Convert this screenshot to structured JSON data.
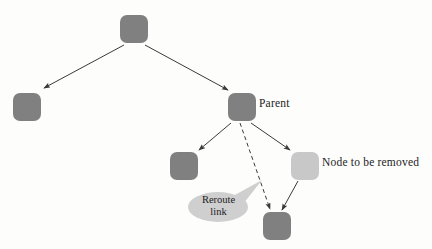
{
  "diagram": {
    "background_color": "#fdfdfc",
    "node_dark_color": "#808080",
    "node_light_color": "#c8c8c8",
    "edge_color": "#3a3a3a",
    "callout_fill": "#cfcfcf",
    "nodes": [
      {
        "id": "root",
        "shade": "dark",
        "x": 120,
        "y": 15,
        "w": 28,
        "h": 28
      },
      {
        "id": "left",
        "shade": "dark",
        "x": 13,
        "y": 93,
        "w": 28,
        "h": 28
      },
      {
        "id": "parent",
        "shade": "dark",
        "x": 228,
        "y": 93,
        "w": 28,
        "h": 28
      },
      {
        "id": "middle",
        "shade": "dark",
        "x": 170,
        "y": 152,
        "w": 28,
        "h": 28
      },
      {
        "id": "removed",
        "shade": "light",
        "x": 291,
        "y": 152,
        "w": 28,
        "h": 28
      },
      {
        "id": "bottom",
        "shade": "dark",
        "x": 263,
        "y": 212,
        "w": 28,
        "h": 28
      }
    ],
    "edges": [
      {
        "id": "root-to-left",
        "style": "solid",
        "from": "root",
        "to": "left"
      },
      {
        "id": "root-to-parent",
        "style": "solid",
        "from": "root",
        "to": "parent"
      },
      {
        "id": "parent-to-middle",
        "style": "solid",
        "from": "parent",
        "to": "middle"
      },
      {
        "id": "parent-to-removed",
        "style": "solid",
        "from": "parent",
        "to": "removed"
      },
      {
        "id": "removed-to-bottom",
        "style": "solid",
        "from": "removed",
        "to": "bottom"
      },
      {
        "id": "parent-to-bottom",
        "style": "dashed",
        "from": "parent",
        "to": "bottom"
      }
    ],
    "labels": {
      "parent": "Parent",
      "removed": "Node to be removed"
    },
    "callout": {
      "line1": "Reroute",
      "line2": "link"
    }
  }
}
